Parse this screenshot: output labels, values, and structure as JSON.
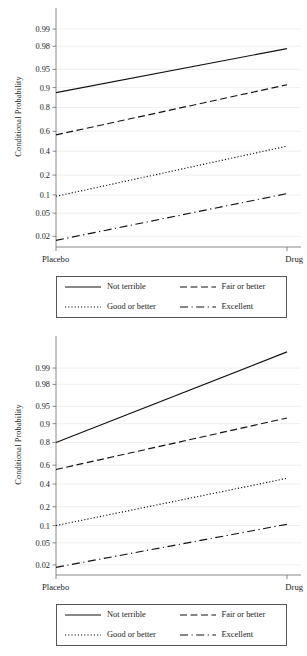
{
  "figure": {
    "panel_count": 2,
    "background": "#ffffff",
    "line_color": "#111111",
    "grid_color": "#e3e3e3",
    "axis_color": "#6b6b6b"
  },
  "chart_data": [
    {
      "type": "line",
      "title": "",
      "subtitle": "",
      "xlabel": "",
      "ylabel": "Conditional Probability",
      "scale": "logit",
      "grid": true,
      "legend_position": "below",
      "x": [
        "Placebo",
        "Drug"
      ],
      "categories": [
        "Placebo",
        "Drug"
      ],
      "xtick_labels": [
        "Placebo",
        "Drug"
      ],
      "ytick_labels": [
        "0.99",
        "0.98",
        "0.95",
        "0.9",
        "0.8",
        "0.6",
        "0.4",
        "0.2",
        "0.1",
        "0.05",
        "0.02"
      ],
      "ytick_values": [
        0.99,
        0.98,
        0.95,
        0.9,
        0.8,
        0.6,
        0.4,
        0.2,
        0.1,
        0.05,
        0.02
      ],
      "ylim": [
        0.013,
        0.995
      ],
      "series": [
        {
          "name": "Not terrible",
          "style": "solid",
          "values": [
            0.88,
            0.978
          ]
        },
        {
          "name": "Fair or better",
          "style": "dashed",
          "values": [
            0.565,
            0.91
          ]
        },
        {
          "name": "Good or better",
          "style": "dotted",
          "values": [
            0.095,
            0.45
          ]
        },
        {
          "name": "Excellent",
          "style": "dashdot",
          "values": [
            0.017,
            0.105
          ]
        }
      ]
    },
    {
      "type": "line",
      "title": "",
      "subtitle": "",
      "xlabel": "",
      "ylabel": "Conditional Probability",
      "scale": "logit",
      "grid": true,
      "legend_position": "below",
      "x": [
        "Placebo",
        "Drug"
      ],
      "categories": [
        "Placebo",
        "Drug"
      ],
      "xtick_labels": [
        "Placebo",
        "Drug"
      ],
      "ytick_labels": [
        "0.99",
        "0.98",
        "0.95",
        "0.9",
        "0.8",
        "0.6",
        "0.4",
        "0.2",
        "0.1",
        "0.05",
        "0.02"
      ],
      "ytick_values": [
        0.99,
        0.98,
        0.95,
        0.9,
        0.8,
        0.6,
        0.4,
        0.2,
        0.1,
        0.05,
        0.02
      ],
      "ylim": [
        0.013,
        0.997
      ],
      "series": [
        {
          "name": "Not terrible",
          "style": "solid",
          "values": [
            0.8,
            0.995
          ]
        },
        {
          "name": "Fair or better",
          "style": "dashed",
          "values": [
            0.555,
            0.92
          ]
        },
        {
          "name": "Good or better",
          "style": "dotted",
          "values": [
            0.1,
            0.46
          ]
        },
        {
          "name": "Excellent",
          "style": "dashdot",
          "values": [
            0.018,
            0.105
          ]
        }
      ]
    }
  ],
  "panels": [
    {
      "ylabel": "Conditional Probability",
      "legend": {
        "items": [
          {
            "label": "Not terrible",
            "style": "solid"
          },
          {
            "label": "Fair or better",
            "style": "dashed"
          },
          {
            "label": "Good or better",
            "style": "dotted"
          },
          {
            "label": "Excellent",
            "style": "dashdot"
          }
        ]
      }
    },
    {
      "ylabel": "Conditional Probability",
      "legend": {
        "items": [
          {
            "label": "Not terrible",
            "style": "solid"
          },
          {
            "label": "Fair or better",
            "style": "dashed"
          },
          {
            "label": "Good or better",
            "style": "dotted"
          },
          {
            "label": "Excellent",
            "style": "dashdot"
          }
        ]
      }
    }
  ]
}
